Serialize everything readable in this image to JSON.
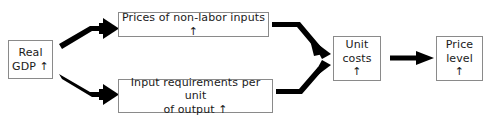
{
  "diagram": {
    "type": "flowchart",
    "title": "",
    "background_color": "#ffffff",
    "box_border_color": "#8a8a8a",
    "arrow_color": "#000000",
    "text_color": "#1a1a1a",
    "nodes": [
      {
        "id": "real-gdp",
        "label": "Real\nGDP  ↑",
        "line1": "Real",
        "line2": "GDP  ↑",
        "direction": "up"
      },
      {
        "id": "prices-non-labor-inputs",
        "label": "Prices of non-labor inputs  ↑",
        "direction": "up"
      },
      {
        "id": "input-requirements",
        "label": "Input requirements per unit\nof output  ↑",
        "line1": "Input requirements per unit",
        "line2": "of output  ↑",
        "direction": "up"
      },
      {
        "id": "unit-costs",
        "label": "Unit\ncosts  ↑",
        "line1": "Unit",
        "line2": "costs  ↑",
        "direction": "up"
      },
      {
        "id": "price-level",
        "label": "Price\nlevel  ↑",
        "line1": "Price",
        "line2": "level  ↑",
        "direction": "up"
      }
    ],
    "edges": [
      {
        "id": "edge-gdp-to-prices",
        "from": "real-gdp",
        "to": "prices-non-labor-inputs",
        "shape": "bent-up",
        "style": "thick-solid-arrow"
      },
      {
        "id": "edge-gdp-to-input-req",
        "from": "real-gdp",
        "to": "input-requirements",
        "shape": "bent-down",
        "style": "thick-solid-arrow"
      },
      {
        "id": "edge-prices-to-unit-costs",
        "from": "prices-non-labor-inputs",
        "to": "unit-costs",
        "shape": "bent-down",
        "style": "thick-solid-arrow"
      },
      {
        "id": "edge-input-req-to-unit-costs",
        "from": "input-requirements",
        "to": "unit-costs",
        "shape": "bent-up",
        "style": "thick-solid-arrow"
      },
      {
        "id": "edge-unit-costs-to-price-level",
        "from": "unit-costs",
        "to": "price-level",
        "shape": "straight",
        "style": "thick-solid-arrow"
      }
    ]
  }
}
